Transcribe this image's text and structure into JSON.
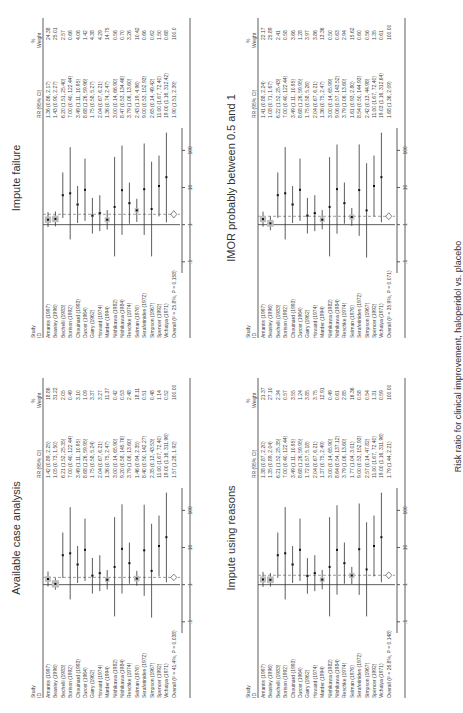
{
  "figure": {
    "xlabel": "Risk ratio for clinical improvement, haloperidol vs. placebo",
    "headers": {
      "study": "Study",
      "id": "ID",
      "rr": "RR (95% CI)",
      "pct": "%",
      "weight": "Weight"
    },
    "ticks": [
      ".1",
      "1",
      "10",
      "100"
    ]
  },
  "chart_data": [
    {
      "type": "forest",
      "title": "Available case analysis",
      "studies": [
        "Amantis (1997)",
        "Beasley (1996)",
        "Bechelli (1983)",
        "Borison (1992)",
        "Chouinard (1993)",
        "Durost (1964)",
        "Garry (1962)",
        "Howard (1974)",
        "Marder (1994)",
        "Nishikawa (1982)",
        "Nishikawa (1984)",
        "Reschke (1974)",
        "Selman (1976)",
        "Serafetinides (1972)",
        "Simpson (1967)",
        "Spencer (1992)",
        "Vichaiya (1971)"
      ],
      "rr": [
        "1.42 (0.89, 2.25)",
        "1.05 (0.73, 1.50)",
        "6.21 (1.52, 25.35)",
        "7.00 (0.40, 122.44)",
        "3.49 (1.11, 10.95)",
        "8.68 (1.26, 59.95)",
        "1.75 (0.58, 5.24)",
        "2.04 (0.67, 6.21)",
        "1.36 (0.75, 2.47)",
        "3.00 (0.14, 65.90)",
        "9.20 (0.58, 145.76)",
        "3.79 (1.06, 13.60)",
        "1.46 (0.94, 2.35)",
        "8.40 (0.50, 142.27)",
        "2.35 (0.13, 43.53)",
        "11.00 (1.67, 72.40)",
        "19.00 (1.16, 311.96)"
      ],
      "weight": [
        "18.86",
        "31.22",
        "2.05",
        "0.49",
        "3.10",
        "1.09",
        "3.37",
        "3.27",
        "11.37",
        "0.42",
        "0.53",
        "2.48",
        "18.11",
        "0.51",
        "0.48",
        "1.14",
        "0.52"
      ],
      "overall": "Overall (I² = 41.4%, P = 0.038)",
      "overall_rr": "1.57 (1.28, 1.92)",
      "overall_weight": "100.00",
      "est": [
        1.42,
        1.05,
        6.21,
        7.0,
        3.49,
        8.68,
        1.75,
        2.04,
        1.36,
        3.0,
        9.2,
        3.79,
        1.46,
        8.4,
        2.35,
        11.0,
        19.0
      ],
      "lo": [
        0.89,
        0.73,
        1.52,
        0.4,
        1.11,
        1.26,
        0.58,
        0.67,
        0.75,
        0.14,
        0.58,
        1.06,
        0.94,
        0.5,
        0.13,
        1.67,
        1.16
      ],
      "hi": [
        2.25,
        1.5,
        25.35,
        122.44,
        10.95,
        59.95,
        5.24,
        6.21,
        2.47,
        65.9,
        145.76,
        13.6,
        2.35,
        142.27,
        43.53,
        72.4,
        311.96
      ],
      "ov": [
        1.57,
        1.28,
        1.92
      ]
    },
    {
      "type": "forest",
      "title": "Impute failure",
      "studies": [
        "Amantis (1997)",
        "Beasley (1996)",
        "Bechelli (1983)",
        "Borison (1992)",
        "Chouinard (1993)",
        "Durost (1964)",
        "Garry (1962)",
        "Howard (1974)",
        "Marder (1994)",
        "Nishikawa (1982)",
        "Nishikawa (1984)",
        "Reschke (1974)",
        "Selman (1976)",
        "Serafetinides (1972)",
        "Simpson (1967)",
        "Spencer (1992)",
        "Vichaiya (1971)"
      ],
      "rr": [
        "1.36 (0.86, 2.17)",
        "1.43 (0.90, 2.27)",
        "6.20 (1.51, 25.40)",
        "7.00 (0.40, 122.44)",
        "3.49 (1.11, 10.95)",
        "8.68 (1.26, 59.96)",
        "1.75 (0.58, 5.27)",
        "2.04 (0.67, 6.21)",
        "1.36 (0.74, 2.47)",
        "3.00 (0.14, 66.90)",
        "8.47 (0.53, 134.46)",
        "3.79 (1.06, 13.60)",
        "2.43 (1.19, 4.96)",
        "9.00 (0.53, 152.93)",
        "2.65 (0.14, 49.42)",
        "11.00 (1.67, 72.40)",
        "19.00 (1.16, 312.42)"
      ],
      "weight": [
        "24.38",
        "25.01",
        "2.57",
        "0.66",
        "4.06",
        "1.42",
        "4.38",
        "4.29",
        "14.75",
        "0.56",
        "0.70",
        "3.26",
        "10.42",
        "0.66",
        "0.62",
        "1.50",
        "0.68"
      ],
      "overall": "Overall (I² = 25.8%, P = 0.158)",
      "overall_rr": "1.90 (1.51, 2.39)",
      "overall_weight": "100.0",
      "est": [
        1.36,
        1.43,
        6.2,
        7.0,
        3.49,
        8.68,
        1.75,
        2.04,
        1.36,
        3.0,
        8.47,
        3.79,
        2.43,
        9.0,
        2.65,
        11.0,
        19.0
      ],
      "lo": [
        0.86,
        0.9,
        1.51,
        0.4,
        1.11,
        1.26,
        0.58,
        0.67,
        0.74,
        0.14,
        0.53,
        1.06,
        1.19,
        0.53,
        0.14,
        1.67,
        1.16
      ],
      "hi": [
        2.17,
        2.27,
        25.4,
        122.44,
        10.95,
        59.96,
        5.27,
        6.21,
        2.47,
        66.9,
        134.46,
        13.6,
        4.96,
        152.93,
        49.42,
        72.4,
        312.42
      ],
      "ov": [
        1.9,
        1.51,
        2.39
      ]
    },
    {
      "type": "forest",
      "title": "Impute using reasons",
      "studies": [
        "Amantis (1997)",
        "Beasley (1996)",
        "Bechelli (1983)",
        "Borison (1992)",
        "Chouinard (1993)",
        "Durost (1964)",
        "Garry (1962)",
        "Howard (1974)",
        "Marder (1994)",
        "Nishikawa (1982)",
        "Nishikawa (1984)",
        "Reschke (1974)",
        "Selman (1976)",
        "Serafetinides (1972)",
        "Simpson (1967)",
        "Spencer (1992)",
        "Vichaiya (1971)"
      ],
      "rr": [
        "1.38 (0.87, 2.20)",
        "1.35 (0.89, 2.04)",
        "6.21 (1.52, 25.35)",
        "7.00 (0.40, 122.44)",
        "3.49 (1.11, 10.95)",
        "8.68 (1.26, 59.95)",
        "1.72 (0.57, 5.18)",
        "2.04 (0.67, 6.21)",
        "1.37 (0.75, 2.49)",
        "3.00 (0.14, 65.90)",
        "8.64 (0.54, 137.12)",
        "3.79 (1.06, 13.60)",
        "1.77 (1.04, 3.01)",
        "9.00 (0.53, 152.93)",
        "2.57 (0.14, 47.82)",
        "11.00 (1.67, 72.40)",
        "19.00 (1.16, 311.96)"
      ],
      "weight": [
        "21.37",
        "27.10",
        "2.34",
        "0.57",
        "3.55",
        "1.24",
        "3.85",
        "3.75",
        "12.91",
        "0.49",
        "0.61",
        "2.85",
        "16.36",
        "0.58",
        "0.54",
        "1.31",
        "0.59"
      ],
      "overall": "Overall (I² = 26.8%, P = 0.148)",
      "overall_rr": "1.79 (1.44, 2.21)",
      "overall_weight": "100.00",
      "est": [
        1.38,
        1.35,
        6.21,
        7.0,
        3.49,
        8.68,
        1.72,
        2.04,
        1.37,
        3.0,
        8.64,
        3.79,
        1.77,
        9.0,
        2.57,
        11.0,
        19.0
      ],
      "lo": [
        0.87,
        0.89,
        1.52,
        0.4,
        1.11,
        1.26,
        0.57,
        0.67,
        0.75,
        0.14,
        0.54,
        1.06,
        1.04,
        0.53,
        0.14,
        1.67,
        1.16
      ],
      "hi": [
        2.2,
        2.04,
        25.35,
        122.44,
        10.95,
        59.95,
        5.18,
        6.21,
        2.49,
        65.9,
        137.12,
        13.6,
        3.01,
        152.93,
        47.82,
        72.4,
        311.96
      ],
      "ov": [
        1.79,
        1.44,
        2.21
      ]
    },
    {
      "type": "forest",
      "title": "IMOR probably between 0.5 and 1",
      "studies": [
        "Amantis (1997)",
        "Beasley (1996)",
        "Bechelli (1983)",
        "Borison (1992)",
        "Chouinard (1993)",
        "Durost (1964)",
        "Garry (1962)",
        "Howard (1974)",
        "Marder (1994)",
        "Nishikawa (1982)",
        "Nishikawa (1984)",
        "Reschke (1974)",
        "Selman (1976)",
        "Serafetinides (1972)",
        "Simpson (1967)",
        "Spencer (1992)",
        "Vichaiya (1971)"
      ],
      "rr": [
        "1.41 (0.88, 2.24)",
        "1.08 (0.71, 1.67)",
        "6.22 (1.52, 25.43)",
        "7.00 (0.40, 122.44)",
        "3.49 (1.11, 10.95)",
        "8.68 (1.26, 59.95)",
        "1.75 (0.58, 5.26)",
        "2.04 (0.67, 6.21)",
        "1.36 (0.75, 2.47)",
        "3.00 (0.14, 65.99)",
        "9.06 (0.57, 143.52)",
        "3.79 (1.06, 13.60)",
        "1.61 (0.93, 2.80)",
        "8.54 (0.50, 144.93)",
        "2.42 (0.13, 44.98)",
        "11.00 (1.67, 72.40)",
        "19.03 (1.16, 312.64)"
      ],
      "weight": [
        "22.17",
        "25.89",
        "2.41",
        "0.58",
        "3.66",
        "1.28",
        "3.97",
        "3.86",
        "13.36",
        "0.50",
        "0.63",
        "2.94",
        "15.62",
        "0.60",
        "0.56",
        "1.35",
        "0.61"
      ],
      "overall": "Overall (I² = 35.9%, P = 0.071)",
      "overall_rr": "1.68 (1.36, 2.09)",
      "overall_weight": "100.00",
      "est": [
        1.41,
        1.08,
        6.22,
        7.0,
        3.49,
        8.68,
        1.75,
        2.04,
        1.36,
        3.0,
        9.06,
        3.79,
        1.61,
        8.54,
        2.42,
        11.0,
        19.03
      ],
      "lo": [
        0.88,
        0.71,
        1.52,
        0.4,
        1.11,
        1.26,
        0.58,
        0.67,
        0.75,
        0.14,
        0.57,
        1.06,
        0.93,
        0.5,
        0.13,
        1.67,
        1.16
      ],
      "hi": [
        2.24,
        1.67,
        25.43,
        122.44,
        10.95,
        59.95,
        5.26,
        6.21,
        2.47,
        65.99,
        143.52,
        13.6,
        2.8,
        144.93,
        44.98,
        72.4,
        312.64
      ],
      "ov": [
        1.68,
        1.36,
        2.09
      ]
    }
  ]
}
